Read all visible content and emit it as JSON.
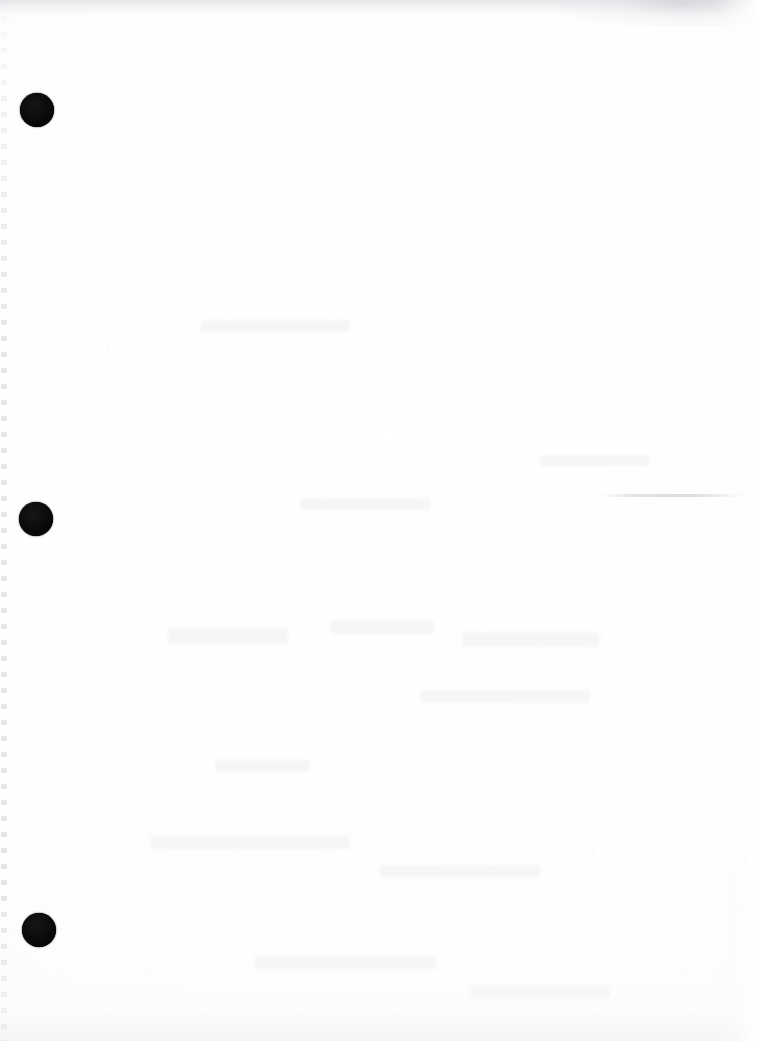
{
  "page": {
    "kind": "scanned-blank-page",
    "description": "Scanned blank sheet of paper, no printed text or graphics",
    "width_px": 757,
    "height_px": 1041,
    "paper_color": "#fdfdfe",
    "background_color": "#ffffff",
    "orientation": "portrait"
  },
  "punch_holes": {
    "label": "binder punch holes",
    "count": 3,
    "color": "#090909",
    "items": [
      {
        "name": "punch-hole-top",
        "cx": 37,
        "cy": 110,
        "r": 17
      },
      {
        "name": "punch-hole-middle",
        "cx": 36,
        "cy": 519,
        "r": 17
      },
      {
        "name": "punch-hole-bottom",
        "cx": 39,
        "cy": 930,
        "r": 17
      }
    ]
  },
  "artifacts": {
    "left_edge_strip": {
      "name": "left-edge-dashed-artifact",
      "color": "#b2b4b9",
      "x": 1,
      "width": 6
    },
    "top_scan_band": {
      "name": "top-scan-edge-band",
      "color": "#e1e2e5",
      "height": 20
    },
    "top_right_smudge": {
      "name": "top-right-smudge",
      "color": "#c8cace",
      "x": 560,
      "width": 197,
      "height": 26
    },
    "crease": {
      "name": "right-side-crease",
      "color": "#c4c6cc",
      "x": 600,
      "y": 494,
      "width": 157
    },
    "bottom_haze": {
      "name": "bottom-edge-haze",
      "color": "#f3f3f5",
      "height": 64
    },
    "show_through": {
      "name": "reverse-side-show-through",
      "color": "#f6f6f8",
      "regions": [
        {
          "x": 168,
          "y": 628,
          "width": 120,
          "height": 16
        },
        {
          "x": 330,
          "y": 620,
          "width": 104,
          "height": 14
        },
        {
          "x": 462,
          "y": 632,
          "width": 138,
          "height": 15
        },
        {
          "x": 200,
          "y": 320,
          "width": 150,
          "height": 12
        },
        {
          "x": 420,
          "y": 690,
          "width": 170,
          "height": 13
        },
        {
          "x": 150,
          "y": 835,
          "width": 200,
          "height": 14
        },
        {
          "x": 380,
          "y": 865,
          "width": 160,
          "height": 13
        },
        {
          "x": 255,
          "y": 955,
          "width": 180,
          "height": 15
        },
        {
          "x": 470,
          "y": 985,
          "width": 140,
          "height": 14
        },
        {
          "x": 300,
          "y": 498,
          "width": 130,
          "height": 12
        },
        {
          "x": 540,
          "y": 455,
          "width": 110,
          "height": 11
        },
        {
          "x": 215,
          "y": 760,
          "width": 95,
          "height": 12
        }
      ]
    }
  }
}
